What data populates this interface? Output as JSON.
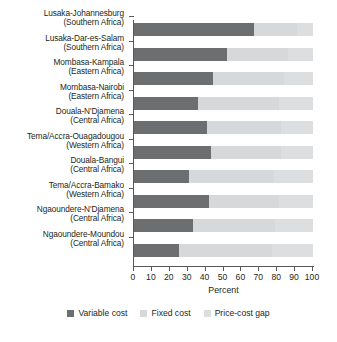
{
  "chart_data": {
    "type": "bar",
    "orientation": "horizontal",
    "stacked": true,
    "title": "",
    "xlabel": "Percent",
    "ylabel": "",
    "xlim": [
      0,
      100
    ],
    "xticks": [
      0,
      10,
      20,
      30,
      40,
      50,
      60,
      70,
      80,
      90,
      100
    ],
    "xtick_labels": [
      "0",
      "10",
      "20",
      "30",
      "40",
      "50",
      "60",
      "70",
      "80",
      "90",
      "100"
    ],
    "grid": false,
    "legend_position": "bottom",
    "categories": [
      "Lusaka-Johannesburg (Southern Africa)",
      "Lusaka-Dar-es-Salam (Southern Africa)",
      "Mombasa-Kampala (Eastern Africa)",
      "Mombasa-Nairobi (Eastern Africa)",
      "Douala-N'Djamena (Central Africa)",
      "Tema/Accra-Ouagadougou (Western Africa)",
      "Douala-Bangui (Central Africa)",
      "Tema/Accra-Bamako (Western Africa)",
      "Ngaoundere-N'Djamena (Central Africa)",
      "Ngaoundere-Moundou (Central Africa)"
    ],
    "category_lines": [
      [
        "Lusaka-Johannesburg",
        "(Southern Africa)"
      ],
      [
        "Lusaka-Dar-es-Salam",
        "(Southern Africa)"
      ],
      [
        "Mombasa-Kampala",
        "(Eastern Africa)"
      ],
      [
        "Mombasa-Nairobi",
        "(Eastern Africa)"
      ],
      [
        "Douala-N'Djamena",
        "(Central Africa)"
      ],
      [
        "Tema/Accra-Ouagadougou",
        "(Western Africa)"
      ],
      [
        "Douala-Bangui",
        "(Central Africa)"
      ],
      [
        "Tema/Accra-Bamako",
        "(Western Africa)"
      ],
      [
        "Ngaoundere-N'Djamena",
        "(Central Africa)"
      ],
      [
        "Ngaoundere-Moundou",
        "(Central Africa)"
      ]
    ],
    "series": [
      {
        "name": "Variable cost",
        "color": "#6d6e70",
        "values": [
          67,
          52,
          44,
          36,
          41,
          43,
          31,
          42,
          33,
          25
        ]
      },
      {
        "name": "Fixed cost",
        "color": "#d7d8d9",
        "values": [
          24,
          34,
          40,
          45,
          41,
          39,
          47,
          39,
          46,
          52
        ]
      },
      {
        "name": "Price-cost gap",
        "color": "#dddedf",
        "values": [
          9,
          14,
          16,
          19,
          18,
          18,
          22,
          19,
          21,
          23
        ]
      }
    ]
  },
  "legend": {
    "items": [
      {
        "label": "Variable cost",
        "color": "#6d6e70"
      },
      {
        "label": "Fixed cost",
        "color": "#d7d8d9"
      },
      {
        "label": "Price-cost gap",
        "color": "#dddedf"
      }
    ]
  },
  "axis": {
    "x_title": "Percent"
  }
}
